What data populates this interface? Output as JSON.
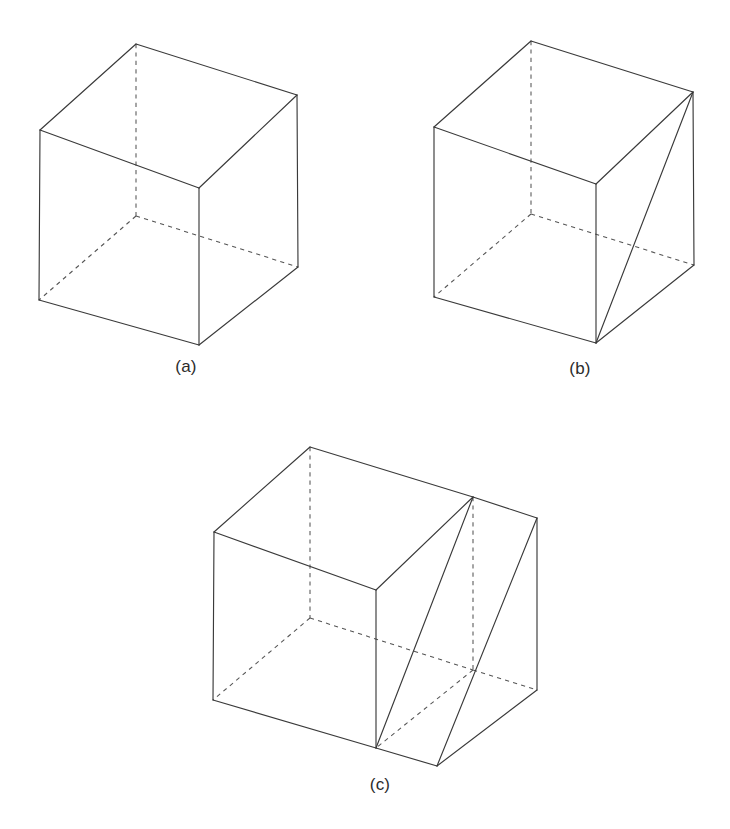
{
  "page": {
    "background_color": "#ffffff",
    "width": 730,
    "height": 829,
    "line_color": "#3a3a3a",
    "hidden_line_color": "#555555",
    "caption_color": "#2b2b2b"
  },
  "figures": [
    {
      "id": "figure-a",
      "caption": "(a)",
      "caption_x": 186,
      "caption_y": 372,
      "description": "cube wireframe with hidden edges dashed",
      "vertices": {
        "front_top_left": [
          40,
          130
        ],
        "front_top_right": [
          199,
          188
        ],
        "front_bottom_left": [
          39,
          300
        ],
        "front_bottom_right": [
          199,
          345
        ],
        "back_top_left": [
          136,
          44
        ],
        "back_top_right": [
          297,
          95
        ],
        "back_bottom_left": [
          136,
          216
        ],
        "back_bottom_right": [
          298,
          267
        ]
      },
      "solid_edges": [
        [
          "front_top_left",
          "front_top_right"
        ],
        [
          "front_top_right",
          "front_bottom_right"
        ],
        [
          "front_bottom_right",
          "front_bottom_left"
        ],
        [
          "front_bottom_left",
          "front_top_left"
        ],
        [
          "front_top_left",
          "back_top_left"
        ],
        [
          "back_top_left",
          "back_top_right"
        ],
        [
          "back_top_right",
          "front_top_right"
        ],
        [
          "back_top_right",
          "back_bottom_right"
        ],
        [
          "back_bottom_right",
          "front_bottom_right"
        ]
      ],
      "dashed_edges": [
        [
          "back_top_left",
          "back_bottom_left"
        ],
        [
          "back_bottom_left",
          "back_bottom_right"
        ],
        [
          "back_bottom_left",
          "front_bottom_left"
        ]
      ],
      "diagonals": []
    },
    {
      "id": "figure-b",
      "caption": "(b)",
      "caption_x": 580,
      "caption_y": 374,
      "description": "cube wireframe with one face diagonal drawn on the right side face",
      "vertices": {
        "front_top_left": [
          434,
          127
        ],
        "front_top_right": [
          596,
          184
        ],
        "front_bottom_left": [
          434,
          297
        ],
        "front_bottom_right": [
          596,
          343
        ],
        "back_top_left": [
          531,
          41
        ],
        "back_top_right": [
          693,
          92
        ],
        "back_bottom_left": [
          531,
          214
        ],
        "back_bottom_right": [
          694,
          265
        ]
      },
      "solid_edges": [
        [
          "front_top_left",
          "front_top_right"
        ],
        [
          "front_top_right",
          "front_bottom_right"
        ],
        [
          "front_bottom_right",
          "front_bottom_left"
        ],
        [
          "front_bottom_left",
          "front_top_left"
        ],
        [
          "front_top_left",
          "back_top_left"
        ],
        [
          "back_top_left",
          "back_top_right"
        ],
        [
          "back_top_right",
          "front_top_right"
        ],
        [
          "back_top_right",
          "back_bottom_right"
        ],
        [
          "back_bottom_right",
          "front_bottom_right"
        ]
      ],
      "dashed_edges": [
        [
          "back_top_left",
          "back_bottom_left"
        ],
        [
          "back_bottom_left",
          "back_bottom_right"
        ],
        [
          "back_bottom_left",
          "front_bottom_left"
        ]
      ],
      "diagonals": [
        [
          "back_top_right",
          "front_bottom_right"
        ]
      ]
    },
    {
      "id": "figure-c",
      "caption": "(c)",
      "caption_x": 380,
      "caption_y": 790,
      "description": "elongated box wireframe (two cubes deep) with two face diagonals forming a zigzag",
      "vertices": {
        "front_top_left": [
          214,
          532
        ],
        "front_top_mid": [
          376,
          590
        ],
        "front_bottom_left": [
          213,
          700
        ],
        "front_bottom_mid": [
          376,
          748
        ],
        "back_top_left": [
          310,
          447
        ],
        "back_top_mid": [
          473,
          497
        ],
        "back_top_right": [
          537,
          518
        ],
        "back_bottom_mid": [
          473,
          670
        ],
        "back_bottom_right": [
          537,
          690
        ],
        "front_bottom_right": [
          437,
          766
        ],
        "back_bottom_left": [
          310,
          618
        ]
      },
      "solid_edges": [
        [
          "front_top_left",
          "front_top_mid"
        ],
        [
          "front_top_mid",
          "front_bottom_mid"
        ],
        [
          "front_bottom_mid",
          "front_bottom_left"
        ],
        [
          "front_bottom_left",
          "front_top_left"
        ],
        [
          "front_top_left",
          "back_top_left"
        ],
        [
          "back_top_left",
          "back_top_mid"
        ],
        [
          "back_top_mid",
          "front_top_mid"
        ],
        [
          "back_top_mid",
          "back_top_right"
        ],
        [
          "back_top_right",
          "back_bottom_right"
        ],
        [
          "back_bottom_right",
          "front_bottom_right"
        ],
        [
          "front_bottom_right",
          "front_bottom_mid"
        ]
      ],
      "dashed_edges": [
        [
          "back_top_left",
          "back_bottom_left"
        ],
        [
          "back_bottom_left",
          "back_bottom_mid"
        ],
        [
          "back_bottom_left",
          "front_bottom_left"
        ],
        [
          "back_top_mid",
          "back_bottom_mid"
        ],
        [
          "back_bottom_mid",
          "back_bottom_right"
        ],
        [
          "back_bottom_mid",
          "front_bottom_mid"
        ]
      ],
      "diagonals": [
        [
          "back_top_mid",
          "front_bottom_mid"
        ],
        [
          "back_top_right",
          "front_bottom_right"
        ]
      ]
    }
  ]
}
